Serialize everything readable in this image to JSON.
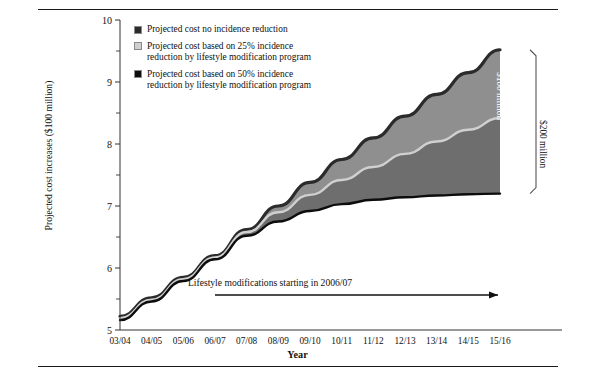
{
  "figure": {
    "has_top_rule": true,
    "has_bottom_rule": true
  },
  "legend": {
    "items": [
      {
        "label": "Projected cost no incidence reduction",
        "color": "#2b2b2b",
        "name": "legend-no-reduction"
      },
      {
        "label": "Projected cost based on 25% incidence\nreduction by lifestyle modification program",
        "color": "#d0d0d0",
        "name": "legend-25-reduction"
      },
      {
        "label": "Projected cost based on 50% incidence\nreduction by lifestyle modification program",
        "color": "#0d0d0d",
        "name": "legend-50-reduction"
      }
    ]
  },
  "annotations": {
    "arrow_text": "Lifestyle modifications starting in 2006/07",
    "bracket_inner_label": "$100 million",
    "bracket_outer_label": "$200 million"
  },
  "chart_data": {
    "type": "area",
    "title": "",
    "xlabel": "Year",
    "ylabel": "Projected cost increases ($100 million)",
    "categories": [
      "03/04",
      "04/05",
      "05/06",
      "06/07",
      "07/08",
      "08/09",
      "09/10",
      "10/11",
      "11/12",
      "12/13",
      "13/14",
      "14/15",
      "15/16"
    ],
    "ylim": [
      5,
      10
    ],
    "yticks": [
      5,
      6,
      7,
      8,
      9,
      10
    ],
    "yticks_minor": [
      5.5,
      6.5,
      7.5,
      8.5,
      9.5
    ],
    "grid": false,
    "legend_position": "top-left-inside",
    "series": [
      {
        "name": "Projected cost no incidence reduction",
        "color": "#2b2b2b",
        "values": [
          5.22,
          5.52,
          5.85,
          6.2,
          6.62,
          7.0,
          7.38,
          7.75,
          8.1,
          8.45,
          8.8,
          9.15,
          9.52
        ]
      },
      {
        "name": "Projected cost based on 25% incidence reduction by lifestyle modification program",
        "color": "#d0d0d0",
        "values": [
          5.19,
          5.49,
          5.82,
          6.17,
          6.58,
          6.9,
          7.18,
          7.42,
          7.63,
          7.84,
          8.04,
          8.23,
          8.42
        ]
      },
      {
        "name": "Projected cost based on 50% incidence reduction by lifestyle modification program",
        "color": "#0d0d0d",
        "values": [
          5.16,
          5.46,
          5.79,
          6.14,
          6.52,
          6.75,
          6.92,
          7.03,
          7.1,
          7.14,
          7.17,
          7.19,
          7.2
        ]
      }
    ],
    "band_fills": {
      "top_band": "#8f8f8f",
      "bottom_band": "#6e6e6e"
    }
  }
}
